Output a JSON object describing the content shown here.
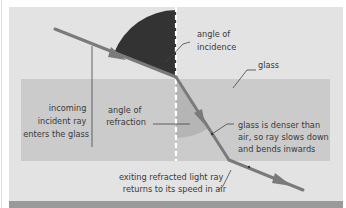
{
  "colors": {
    "background": "#ffffff",
    "air_panel": "#e3e3e3",
    "glass_block": "#cbcbcb",
    "bottom_strip": "#9a9a9a",
    "ray": "#7a7a7a",
    "angle_incidence_fill": "#333333",
    "angle_refraction_fill": "#b3b3b3",
    "normal_line": "#ffffff",
    "leader_line": "#444444",
    "text": "#3a3a3a"
  },
  "labels": {
    "angle_of_incidence": [
      "angle of",
      "incidence"
    ],
    "glass": "glass",
    "incoming_ray": [
      "incoming",
      "incident ray",
      "enters the glass"
    ],
    "angle_of_refraction": [
      "angle of",
      "refraction"
    ],
    "glass_denser": [
      "glass is denser than",
      "air, so ray slows down",
      "and bends inwards"
    ],
    "exiting_ray": [
      "exiting refracted light ray",
      "returns to its speed in air"
    ]
  },
  "icons": {
    "incident_arrow": "arrowhead-icon",
    "refracted_arrow": "arrowhead-icon",
    "exit_arrow": "arrowhead-icon"
  }
}
